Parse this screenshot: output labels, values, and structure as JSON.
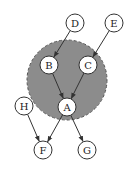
{
  "diagram": {
    "type": "directed-graph",
    "region": {
      "cx": 67,
      "cy": 80,
      "r": 40,
      "fill": "#8c8c8c",
      "stroke": "#555555",
      "dashed": true
    },
    "nodes": [
      {
        "id": "D",
        "label": "D",
        "x": 75,
        "y": 23
      },
      {
        "id": "E",
        "label": "E",
        "x": 114,
        "y": 23
      },
      {
        "id": "B",
        "label": "B",
        "x": 49,
        "y": 65
      },
      {
        "id": "C",
        "label": "C",
        "x": 88,
        "y": 65
      },
      {
        "id": "A",
        "label": "A",
        "x": 67,
        "y": 107
      },
      {
        "id": "H",
        "label": "H",
        "x": 24,
        "y": 106
      },
      {
        "id": "F",
        "label": "F",
        "x": 43,
        "y": 150
      },
      {
        "id": "G",
        "label": "G",
        "x": 87,
        "y": 150
      }
    ],
    "edges": [
      {
        "from": "D",
        "to": "B"
      },
      {
        "from": "E",
        "to": "C"
      },
      {
        "from": "B",
        "to": "A"
      },
      {
        "from": "C",
        "to": "A"
      },
      {
        "from": "H",
        "to": "F"
      },
      {
        "from": "A",
        "to": "F"
      },
      {
        "from": "A",
        "to": "G"
      }
    ]
  }
}
